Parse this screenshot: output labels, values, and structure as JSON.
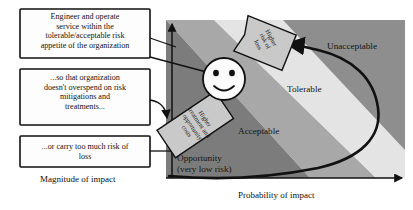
{
  "figure": {
    "callouts": [
      {
        "id": "callout-engineer",
        "text": "Engineer and operate\nservice within the\ntolerable/acceptable risk\nappetite of the organization"
      },
      {
        "id": "callout-overspend",
        "text": "...so that organization\ndoesn't overspend on risk\nmitigations and\ntreatments..."
      },
      {
        "id": "callout-risk-of-loss",
        "text": "...or carry too much risk of\nloss"
      }
    ],
    "rotated_labels": [
      {
        "id": "label-higher-risk-of-loss",
        "text": "Higher\nrisk of\nloss"
      },
      {
        "id": "label-higher-treatment-costs",
        "text": "Higher\ntreatment and\nopportunity\ncosts"
      }
    ],
    "zones": [
      {
        "id": "zone-unacceptable",
        "label": "Unacceptable",
        "color": "#8e8e8e"
      },
      {
        "id": "zone-tolerable",
        "label": "Tolerable",
        "color": "#e4e4e4"
      },
      {
        "id": "zone-acceptable",
        "label": "Acceptable",
        "color": "#a8a8a8"
      },
      {
        "id": "zone-opportunity",
        "label": "Opportunity\n(very low risk)",
        "color": "#7c7c7c"
      }
    ],
    "axes": {
      "y_label": "Magnitude of impact",
      "x_label": "Probability of impact"
    },
    "face": {
      "id": "smiley-face",
      "expression": "smile"
    },
    "colors": {
      "band_light": "#e4e4e4",
      "band_medium": "#a8a8a8",
      "band_dark": "#8e8e8e",
      "band_darkest": "#7c7c7c",
      "outline": "#111111",
      "callout_fill": "#fdfdfd",
      "rot_label_fill": "#c9c9c9",
      "page_bg": "#ffffff"
    }
  }
}
